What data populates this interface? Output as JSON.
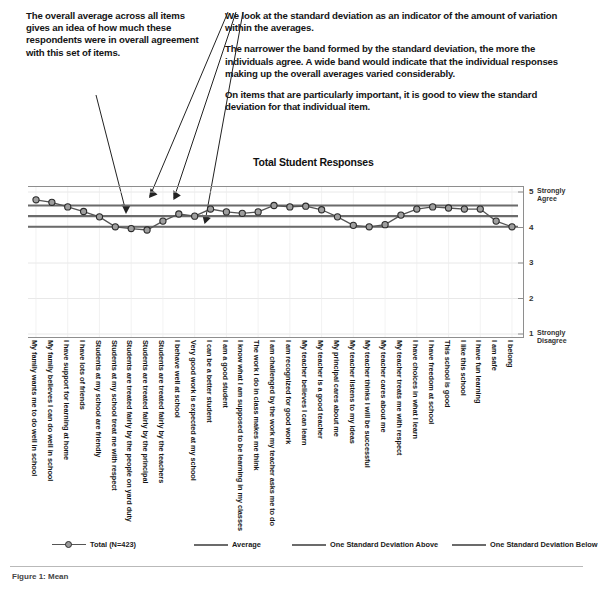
{
  "annotations": {
    "left": "The overall average across all items gives an idea of how much these respondents were in overall agreement with this set of items.",
    "right_paragraphs": [
      "We look at the standard deviation as an indicator of the amount of variation within the averages.",
      "The narrower the band formed by the standard deviation,  the more the individuals agree.  A wide band would indicate that the individual responses making up the overall averages varied considerably.",
      "On items that are particularly important, it is good to view the standard deviation for that individual item."
    ]
  },
  "footer": {
    "note": "Figure 1: Mean"
  },
  "legend": {
    "items": [
      {
        "label": "Total (N=423)",
        "style": "marker-line",
        "color": "#555555"
      },
      {
        "label": "Average",
        "style": "line",
        "color": "#6b6b6b"
      },
      {
        "label": "One Standard Deviation Above",
        "style": "line",
        "color": "#6b6b6b"
      },
      {
        "label": "One Standard Deviation Below",
        "style": "line",
        "color": "#6b6b6b"
      }
    ]
  },
  "chart_data": {
    "type": "line",
    "title": "Total Student Responses",
    "xlabel": "",
    "ylabel": "",
    "ylim": [
      1,
      5
    ],
    "yticks": [
      1,
      2,
      3,
      4,
      5
    ],
    "ytick_labels": [
      "1",
      "2",
      "3",
      "4",
      "5"
    ],
    "y_axis_anchors": {
      "top": "Strongly Agree",
      "bottom": "Strongly Disagree"
    },
    "grid": true,
    "legend_position": "bottom",
    "reference_lines": [
      {
        "name": "One Standard Deviation Above",
        "value": 4.62,
        "color": "#6b6b6b"
      },
      {
        "name": "Average",
        "value": 4.32,
        "color": "#6b6b6b"
      },
      {
        "name": "One Standard Deviation Below",
        "value": 4.02,
        "color": "#6b6b6b"
      }
    ],
    "categories": [
      "My family wants me to do well in school",
      "My family believes I can do well in school",
      "I have support for learning at home",
      "I have lots of friends",
      "I believe well at school",
      "Very good work is expected at my school",
      "I can be a better student",
      "I am a good student",
      "I know what I am supposed to be learning in my classes",
      "The work I do in class makes me think",
      "I am challenged by the work my teacher asks me to do",
      "I am recognized for good work",
      "My teacher believes I can learn",
      "My teacher is a good teacher",
      "My principal cares about me",
      "My teacher listens to my ideas",
      "My teacher thinks I will be successful",
      "My teacher cares about me",
      "My teacher treats me with respect",
      "I have freedom at school",
      "I have choices in what I learn",
      "This school is good",
      "I like this school",
      "I have fun learning",
      "I am safe",
      "I belong",
      "Students are treated fairly by the teachers",
      "Students are treated fairly by the principal",
      "Students are treated fairly by the people on yard duty",
      "Students at my school treat me with respect",
      "Students at my school are friendly"
    ],
    "series": [
      {
        "name": "Total (N=423)",
        "color": "#555555",
        "marker": "circle",
        "values": [
          4.78,
          4.71,
          4.58,
          4.45,
          4.3,
          4.02,
          3.97,
          3.93,
          4.18,
          4.38,
          4.32,
          4.52,
          4.44,
          4.4,
          4.44,
          4.62,
          4.58,
          4.6,
          4.5,
          4.3,
          4.06,
          4.02,
          4.08,
          4.35,
          4.52,
          4.58,
          4.55,
          4.52,
          4.52,
          4.18,
          4.02
        ]
      }
    ],
    "ordered_display_categories": [
      "My family wants me to do well in school",
      "My family believes I can do well in school",
      "I have support for learning at home",
      "I have lots of friends",
      "Students at my school are friendly",
      "Students at my school treat me with respect",
      "Students are treated fairly by the people on yard duty",
      "Students are treated fairly by the principal",
      "Students are treated fairly by the teachers",
      "I behave well at school",
      "Very good work is expected at my school",
      "I can be a better student",
      "I am a good student",
      "I know what I am supposed to be learning in my classes",
      "The work I do in class makes me think",
      "I am challenged by the work my teacher asks me to do",
      "I am recognized for good work",
      "My teacher believes I can learn",
      "My teacher is a good teacher",
      "My principal cares about me",
      "My teacher listens to my ideas",
      "My teacher thinks I will be successful",
      "My teacher cares about me",
      "My teacher treats me with respect",
      "I have choices in what I learn",
      "I have freedom at school",
      "This school is good",
      "I like this school",
      "I have fun learning",
      "I am safe",
      "I belong"
    ]
  }
}
